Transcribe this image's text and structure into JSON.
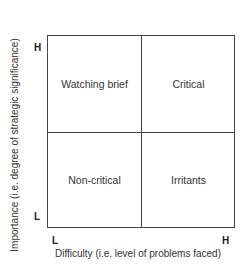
{
  "diagram": {
    "type": "2x2 matrix",
    "quadrants": {
      "top_left": "Watching brief",
      "top_right": "Critical",
      "bottom_left": "Non-critical",
      "bottom_right": "Irritants"
    },
    "y_axis": {
      "label": "Importance (i.e. degree of strategic significance)",
      "low": "L",
      "high": "H"
    },
    "x_axis": {
      "label": "Difficulty (i.e. level of problems faced)",
      "low": "L",
      "high": "H"
    },
    "colors": {
      "line": "#444444",
      "text": "#333333",
      "background": "#ffffff"
    }
  }
}
